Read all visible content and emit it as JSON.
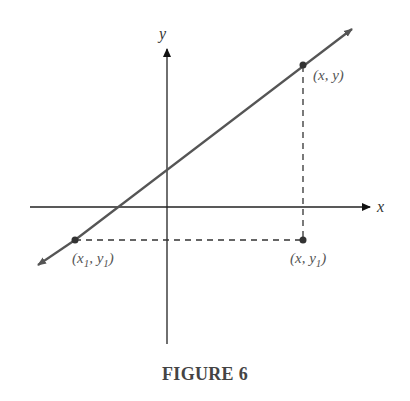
{
  "figure": {
    "caption": "FIGURE 6",
    "axes": {
      "x_label": "x",
      "y_label": "y"
    },
    "points": [
      {
        "id": "p",
        "label_main": "(x, y)"
      },
      {
        "id": "p1",
        "label_pre": "(x",
        "sub1": "1",
        "label_mid": ", y",
        "sub2": "1",
        "label_post": ")"
      },
      {
        "id": "q",
        "label_pre": "(x, y",
        "sub": "1",
        "label_post": ")"
      }
    ],
    "colors": {
      "line": "#555555",
      "axes": "#222222",
      "dashed": "#333333",
      "text": "#555555"
    }
  }
}
